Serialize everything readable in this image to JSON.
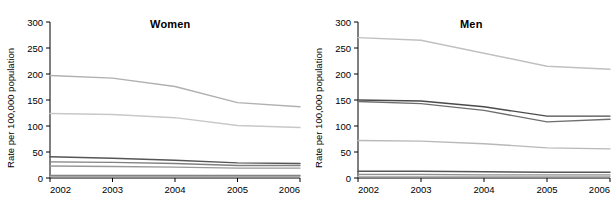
{
  "chart_data": [
    {
      "type": "line",
      "title": "Women",
      "xlabel": "",
      "ylabel": "Rate per 100,000 population",
      "x": [
        2002,
        2003,
        2004,
        2005,
        2006
      ],
      "xlim": [
        2002,
        2006
      ],
      "ylim": [
        0,
        300
      ],
      "yticks": [
        0,
        50,
        100,
        150,
        200,
        250,
        300
      ],
      "xticks": [
        2002,
        2003,
        2004,
        2005,
        2006
      ],
      "grid": false,
      "legend": "none",
      "series": [
        {
          "name": "series-1",
          "values": [
            197,
            192,
            176,
            145,
            137
          ],
          "color": "#b0b0b0"
        },
        {
          "name": "series-2",
          "values": [
            124,
            122,
            116,
            101,
            97
          ],
          "color": "#c8c8c8"
        },
        {
          "name": "series-3",
          "values": [
            41,
            38,
            34,
            29,
            28
          ],
          "color": "#555555"
        },
        {
          "name": "series-4",
          "values": [
            31,
            30,
            28,
            24,
            24
          ],
          "color": "#808080"
        },
        {
          "name": "series-5",
          "values": [
            23,
            22,
            21,
            19,
            19
          ],
          "color": "#999999"
        },
        {
          "name": "series-6",
          "values": [
            5,
            5,
            5,
            5,
            5
          ],
          "color": "#777777"
        },
        {
          "name": "series-7",
          "values": [
            3,
            3,
            3,
            3,
            3
          ],
          "color": "#aaaaaa"
        }
      ]
    },
    {
      "type": "line",
      "title": "Men",
      "xlabel": "",
      "ylabel": "Rate per 100,000 population",
      "x": [
        2002,
        2003,
        2004,
        2005,
        2006
      ],
      "xlim": [
        2002,
        2006
      ],
      "ylim": [
        0,
        300
      ],
      "yticks": [
        0,
        50,
        100,
        150,
        200,
        250,
        300
      ],
      "xticks": [
        2002,
        2003,
        2004,
        2005,
        2006
      ],
      "grid": false,
      "legend": "none",
      "series": [
        {
          "name": "series-1",
          "values": [
            270,
            265,
            240,
            215,
            209
          ],
          "color": "#c0c0c0"
        },
        {
          "name": "series-2",
          "values": [
            150,
            148,
            137,
            119,
            119
          ],
          "color": "#4a4a4a"
        },
        {
          "name": "series-3",
          "values": [
            147,
            143,
            130,
            108,
            113
          ],
          "color": "#6e6e6e"
        },
        {
          "name": "series-4",
          "values": [
            72,
            71,
            66,
            58,
            56
          ],
          "color": "#b8b8b8"
        },
        {
          "name": "series-5",
          "values": [
            13,
            13,
            12,
            11,
            11
          ],
          "color": "#555555"
        },
        {
          "name": "series-6",
          "values": [
            7,
            7,
            6,
            6,
            6
          ],
          "color": "#909090"
        },
        {
          "name": "series-7",
          "values": [
            3,
            3,
            3,
            3,
            3
          ],
          "color": "#b5b5b5"
        }
      ]
    }
  ],
  "panels": [
    {
      "id": "women",
      "title": "Women",
      "ylabel": "Rate per 100,000 population",
      "yticks": [
        "300",
        "250",
        "200",
        "150",
        "100",
        "50",
        "0"
      ],
      "xticks": [
        "2002",
        "2003",
        "2004",
        "2005",
        "2006"
      ]
    },
    {
      "id": "men",
      "title": "Men",
      "ylabel": "Rate per 100,000 population",
      "yticks": [
        "300",
        "250",
        "200",
        "150",
        "100",
        "50",
        "0"
      ],
      "xticks": [
        "2002",
        "2003",
        "2004",
        "2005",
        "2006"
      ]
    }
  ]
}
